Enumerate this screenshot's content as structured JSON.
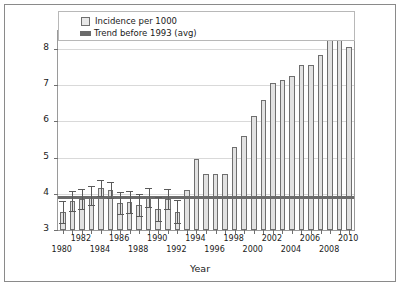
{
  "chart_data": {
    "type": "bar",
    "title": "",
    "xlabel": "Year",
    "ylabel": "Incidence rate (per 1000)",
    "ylim": [
      3,
      8.5
    ],
    "yticks": [
      3,
      4,
      5,
      6,
      7,
      8
    ],
    "grid": true,
    "legend_position": "top",
    "legend": [
      "Incidence per 1000",
      "Trend before 1993 (avg)"
    ],
    "trend_value": 3.9,
    "trend_note": "Trend before 1993 (avg)",
    "error_bars_through_year": 1992,
    "categories": [
      "1980",
      "1981",
      "1982",
      "1983",
      "1984",
      "1985",
      "1986",
      "1987",
      "1988",
      "1989",
      "1990",
      "1991",
      "1992",
      "1993",
      "1994",
      "1995",
      "1996",
      "1997",
      "1998",
      "1999",
      "2000",
      "2001",
      "2002",
      "2003",
      "2004",
      "2005",
      "2006",
      "2007",
      "2008",
      "2009",
      "2010"
    ],
    "values": [
      3.5,
      3.8,
      3.85,
      3.95,
      4.15,
      4.1,
      3.75,
      3.78,
      3.7,
      3.9,
      3.58,
      3.85,
      3.5,
      4.1,
      4.95,
      4.55,
      4.55,
      4.55,
      5.3,
      5.6,
      6.15,
      6.6,
      7.05,
      7.15,
      7.25,
      7.55,
      7.55,
      7.85,
      8.3,
      8.4,
      8.05
    ],
    "errors": [
      0.3,
      0.28,
      0.28,
      0.27,
      0.22,
      0.22,
      0.3,
      0.3,
      0.3,
      0.27,
      0.32,
      0.28,
      0.32
    ],
    "xtick_labels_row1": [
      "1982",
      "1986",
      "1990",
      "1994",
      "1998",
      "2002",
      "2006",
      "2010"
    ],
    "xtick_labels_row2": [
      "1980",
      "1984",
      "1988",
      "1992",
      "1996",
      "2000",
      "2004",
      "2008"
    ]
  },
  "axis": {
    "y_title": "Incidence rate (per 1000)",
    "x_title": "Year"
  },
  "colors": {
    "bar_fill": "#e2e2e2",
    "bar_edge": "#6f6f6f",
    "trend": "#6b6b6b",
    "grid": "#d9d9d9",
    "frame": "#9a9a9a"
  }
}
